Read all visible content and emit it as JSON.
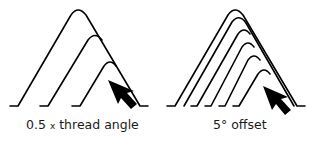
{
  "diagrams": [
    {
      "id": "left",
      "caption_prefix": "0.5",
      "caption_x": "x",
      "caption_suffix": "thread angle",
      "profiles": 3,
      "arrow": "arrow-pointing-up-left"
    },
    {
      "id": "right",
      "caption": "5° offset",
      "profiles": 6,
      "arrow": "arrow-pointing-up-left"
    }
  ],
  "colors": {
    "stroke": "#000000",
    "background": "#ffffff"
  }
}
